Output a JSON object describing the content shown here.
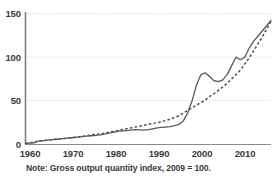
{
  "note": "Note: Gross output quantity index, 2009 = 100.",
  "colors": {
    "line": "#555555",
    "grid": "#d8d8d8",
    "axis": "#6f6f6f",
    "text": "#3a3a3a",
    "background": "#ffffff"
  },
  "chart_data": {
    "type": "line",
    "title": "",
    "subtitle": "",
    "xlabel": "",
    "ylabel": "",
    "annotations": [
      "Note: Gross output quantity index, 2009 = 100."
    ],
    "grid": "horizontal-dotted",
    "legend": "none",
    "xlim": [
      1960,
      2016
    ],
    "ylim": [
      0,
      150
    ],
    "yticks": [
      0,
      50,
      100,
      150
    ],
    "xticks": [
      1960,
      1970,
      1980,
      1990,
      2000,
      2010
    ],
    "x": [
      1960,
      1961,
      1962,
      1963,
      1964,
      1965,
      1966,
      1967,
      1968,
      1969,
      1970,
      1971,
      1972,
      1973,
      1974,
      1975,
      1976,
      1977,
      1978,
      1979,
      1980,
      1981,
      1982,
      1983,
      1984,
      1985,
      1986,
      1987,
      1988,
      1989,
      1990,
      1991,
      1992,
      1993,
      1994,
      1995,
      1996,
      1997,
      1998,
      1999,
      2000,
      2001,
      2002,
      2003,
      2004,
      2005,
      2006,
      2007,
      2008,
      2009,
      2010,
      2011,
      2012,
      2013,
      2014,
      2015,
      2016
    ],
    "series": [
      {
        "name": "solid-series",
        "style": "solid",
        "values": [
          1,
          1.5,
          2,
          4,
          4.5,
          5,
          5.5,
          6,
          6.5,
          7,
          7.5,
          8,
          8.5,
          9,
          9.5,
          10,
          10.5,
          11,
          12,
          13,
          14,
          15,
          15.5,
          16,
          16.5,
          17,
          16.8,
          16.5,
          17,
          18,
          19,
          19.5,
          20,
          20.5,
          21.5,
          23,
          27,
          36,
          50,
          68,
          80,
          82,
          78,
          73,
          72,
          74,
          80,
          90,
          100,
          97,
          100,
          110,
          118,
          124,
          130,
          136,
          142
        ]
      },
      {
        "name": "dashed-series",
        "style": "dashed",
        "values": [
          1.5,
          2,
          3,
          4,
          4.5,
          5,
          5.5,
          6,
          6.5,
          7,
          7.5,
          8,
          8.5,
          9.5,
          10,
          11,
          11.5,
          12,
          13,
          14,
          15,
          16,
          17,
          18,
          19,
          20,
          21,
          22,
          23,
          24,
          25,
          26,
          27.5,
          29,
          31,
          33,
          36,
          39,
          42,
          45,
          48,
          51,
          55,
          58,
          62,
          66,
          70,
          75,
          80,
          85,
          92,
          99,
          107,
          115,
          123,
          132,
          141
        ]
      }
    ]
  },
  "axis": {
    "ytick_labels": [
      "150",
      "100",
      "50",
      "0"
    ],
    "xtick_labels": [
      "1960",
      "1970",
      "1980",
      "1990",
      "2000",
      "2010"
    ]
  }
}
